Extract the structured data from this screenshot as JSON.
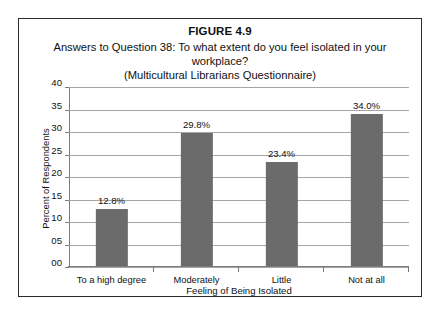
{
  "figure": {
    "label": "FIGURE 4.9",
    "subtitle_line1": "Answers to Question 38: To what extent do you feel isolated in your workplace?",
    "subtitle_line2": "(Multicultural Librarians Questionnaire)"
  },
  "colors": {
    "bar_fill": "#6b6b6b",
    "gridline": "#a6a6a6",
    "axis": "#7a7a7a",
    "frame": "#2b2b2b",
    "text": "#111111",
    "background": "#ffffff"
  },
  "chart_data": {
    "type": "bar",
    "title": "FIGURE 4.9",
    "subtitle": "Answers to Question 38: To what extent do you feel isolated in your workplace? (Multicultural Librarians Questionnaire)",
    "categories": [
      "To a high degree",
      "Moderately",
      "Little",
      "Not at all"
    ],
    "values": [
      12.8,
      29.8,
      23.4,
      34.0
    ],
    "data_labels": [
      "12.8%",
      "29.8%",
      "23.4%",
      "34.0%"
    ],
    "xlabel": "Feeling of Being Isolated",
    "ylabel": "Percent of Respondents",
    "ylim": [
      0,
      40
    ],
    "ytick_values": [
      0,
      5,
      10,
      15,
      20,
      25,
      30,
      35,
      40
    ],
    "ytick_labels": [
      "00",
      "05",
      "10",
      "15",
      "20",
      "25",
      "30",
      "35",
      "40"
    ],
    "grid": true,
    "legend": false,
    "series": [
      {
        "name": "Percent of Respondents",
        "values": [
          12.8,
          29.8,
          23.4,
          34.0
        ]
      }
    ]
  }
}
